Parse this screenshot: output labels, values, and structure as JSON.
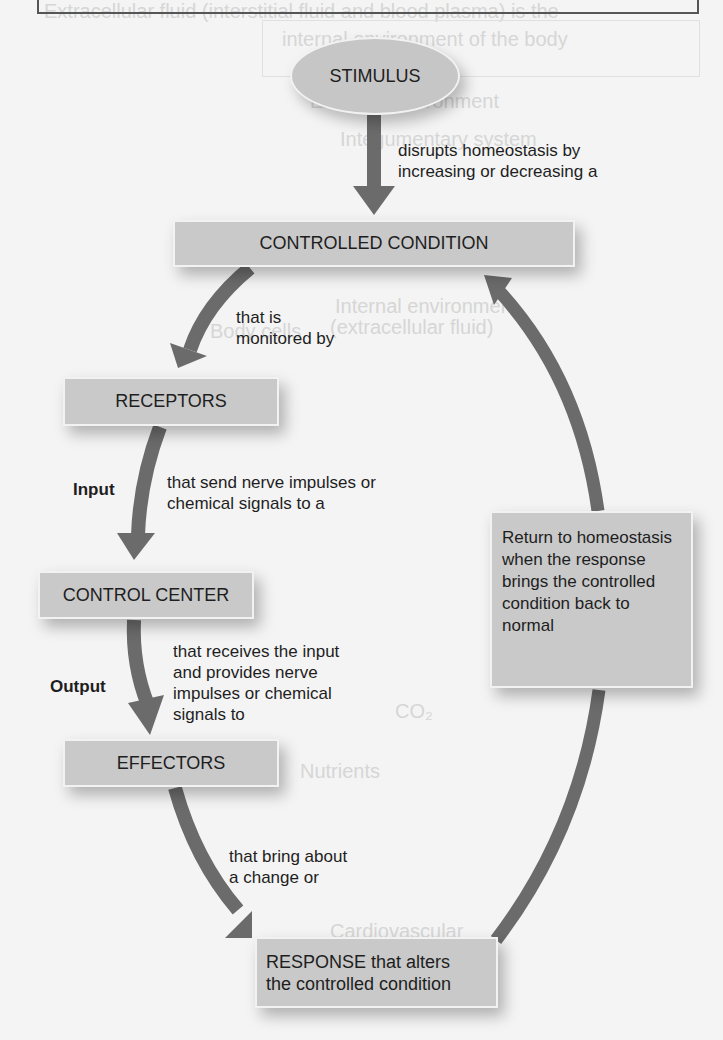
{
  "ghost_background": {
    "lines": [
      {
        "text": "Extracellular fluid (interstitial fluid and blood plasma) is the",
        "x": 44,
        "y": 0
      },
      {
        "text": "internal environment of the body",
        "x": 282,
        "y": 28
      },
      {
        "text": "External environment",
        "x": 310,
        "y": 90
      },
      {
        "text": "Integumentary system",
        "x": 340,
        "y": 128
      },
      {
        "text": "Internal environment",
        "x": 335,
        "y": 295
      },
      {
        "text": "(extracellular fluid)",
        "x": 330,
        "y": 316
      },
      {
        "text": "Body cells",
        "x": 210,
        "y": 320
      },
      {
        "text": "CO₂",
        "x": 395,
        "y": 700
      },
      {
        "text": "Nutrients",
        "x": 300,
        "y": 760
      },
      {
        "text": "Cardiovascular",
        "x": 330,
        "y": 920
      }
    ]
  },
  "diagram": {
    "nodes": {
      "stimulus": "STIMULUS",
      "controlled_condition": "CONTROLLED CONDITION",
      "receptors": "RECEPTORS",
      "control_center": "CONTROL CENTER",
      "effectors": "EFFECTORS",
      "response_line1": "RESPONSE that alters",
      "response_line2": "the controlled condition",
      "return_box": "Return to homeostasis when the response brings the controlled condition back to normal"
    },
    "edge_labels": {
      "stimulus_to_condition_line1": "disrupts homeostasis by",
      "stimulus_to_condition_line2": "increasing or decreasing a",
      "condition_to_receptors_line1": "that is",
      "condition_to_receptors_line2": "monitored by",
      "receptors_to_center_line1": "that send nerve impulses or",
      "receptors_to_center_line2": "chemical signals to a",
      "center_to_effectors_line1": "that receives the input",
      "center_to_effectors_line2": "and provides nerve",
      "center_to_effectors_line3": "impulses or chemical",
      "center_to_effectors_line4": "signals to",
      "effectors_to_response_line1": "that bring about",
      "effectors_to_response_line2": "a change or"
    },
    "side_labels": {
      "input": "Input",
      "output": "Output"
    },
    "colors": {
      "box_fill": "#c9c9c9",
      "arrow": "#6b6b6b",
      "background": "#f4f4f4"
    }
  }
}
